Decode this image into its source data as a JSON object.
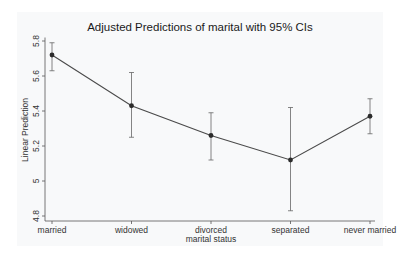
{
  "chart_data": {
    "type": "line",
    "title": "Adjusted Predictions of marital with 95% CIs",
    "xlabel": "marital status",
    "ylabel": "Linear Prediction",
    "categories": [
      "married",
      "widowed",
      "divorced",
      "separated",
      "never married"
    ],
    "series": [
      {
        "name": "Linear Prediction",
        "values": [
          5.72,
          5.43,
          5.26,
          5.12,
          5.37
        ],
        "ci_lower": [
          5.63,
          5.25,
          5.12,
          4.83,
          5.27
        ],
        "ci_upper": [
          5.79,
          5.62,
          5.39,
          5.42,
          5.47
        ]
      }
    ],
    "yticks": [
      4.8,
      5,
      5.2,
      5.4,
      5.6,
      5.8
    ],
    "ytick_labels": [
      "4.8",
      "5",
      "5.2",
      "5.4",
      "5.6",
      "5.8"
    ],
    "ylim": [
      4.78,
      5.82
    ],
    "grid": false,
    "legend": null,
    "colors": {
      "line": "#4a4a4a",
      "marker": "#2b2b2b",
      "axis": "#555555",
      "background": "#ffffff",
      "panel": "#f8f9fa"
    }
  }
}
